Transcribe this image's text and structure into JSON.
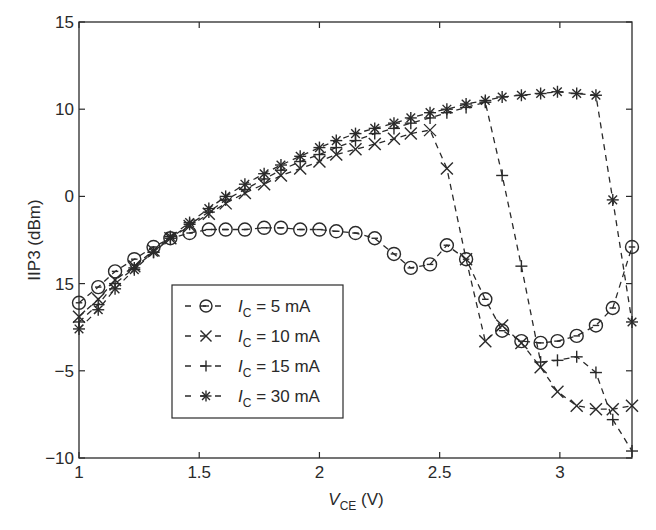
{
  "chart_data": {
    "type": "line",
    "title": "",
    "xlabel": "V_CE (V)",
    "xlabel_main": "V",
    "xlabel_sub": "CE",
    "xlabel_unit": " (V)",
    "ylabel": "IIP3 (dBm)",
    "xlim": [
      1,
      3.3
    ],
    "ylim": [
      -10,
      15
    ],
    "grid": false,
    "legend_position": "lower-left (inside)",
    "x_ticks": [
      1,
      1.5,
      2,
      2.5,
      3
    ],
    "x_tick_labels": [
      "1",
      "1.5",
      "2",
      "2.5",
      "3"
    ],
    "y_ticks": [
      15,
      10,
      5,
      0,
      -5,
      -10
    ],
    "y_tick_labels": [
      "15",
      "10",
      "0",
      "15",
      "−5",
      "−10"
    ],
    "x": [
      1.0,
      1.08,
      1.15,
      1.23,
      1.31,
      1.38,
      1.46,
      1.54,
      1.61,
      1.69,
      1.77,
      1.84,
      1.92,
      2.0,
      2.07,
      2.15,
      2.23,
      2.31,
      2.38,
      2.46,
      2.53,
      2.61,
      2.69,
      2.76,
      2.84,
      2.92,
      2.99,
      3.07,
      3.15,
      3.22,
      3.3
    ],
    "series": [
      {
        "name": "I_C = 5 mA",
        "legend_sub": "C",
        "legend_value": " = 5 mA",
        "marker": "circle",
        "values": [
          -1.1,
          -0.2,
          0.7,
          1.4,
          2.1,
          2.6,
          2.9,
          3.1,
          3.1,
          3.1,
          3.2,
          3.2,
          3.1,
          3.1,
          3.0,
          2.9,
          2.6,
          1.7,
          0.9,
          1.1,
          2.2,
          1.4,
          -0.9,
          -2.7,
          -3.3,
          -3.4,
          -3.3,
          -3.0,
          -2.4,
          -1.4,
          2.1
        ]
      },
      {
        "name": "I_C = 10 mA",
        "legend_sub": "C",
        "legend_value": " = 10 mA",
        "marker": "x",
        "values": [
          -1.9,
          -0.9,
          0.2,
          1.0,
          1.9,
          2.6,
          3.3,
          4.0,
          4.6,
          5.2,
          5.7,
          6.2,
          6.6,
          7.0,
          7.4,
          7.7,
          8.0,
          8.3,
          8.6,
          8.8,
          6.6,
          1.4,
          -3.3,
          -2.4,
          -3.4,
          -4.8,
          -6.2,
          -7.0,
          -7.2,
          -7.2,
          -7.0
        ]
      },
      {
        "name": "I_C = 15 mA",
        "legend_sub": "C",
        "legend_value": " = 15 mA",
        "marker": "plus",
        "values": [
          -2.2,
          -1.2,
          0.0,
          0.9,
          1.8,
          2.6,
          3.4,
          4.1,
          4.8,
          5.4,
          6.0,
          6.5,
          7.0,
          7.4,
          7.8,
          8.2,
          8.6,
          8.9,
          9.2,
          9.5,
          9.8,
          10.1,
          10.4,
          6.2,
          1.0,
          -4.5,
          -4.4,
          -4.2,
          -5.1,
          -7.8,
          -9.6
        ]
      },
      {
        "name": "I_C = 30 mA",
        "legend_sub": "C",
        "legend_value": " = 30 mA",
        "marker": "asterisk",
        "values": [
          -2.6,
          -1.5,
          -0.3,
          0.8,
          1.8,
          2.7,
          3.5,
          4.3,
          5.0,
          5.7,
          6.3,
          6.8,
          7.3,
          7.8,
          8.2,
          8.6,
          8.9,
          9.2,
          9.5,
          9.8,
          10.0,
          10.3,
          10.5,
          10.7,
          10.8,
          10.9,
          11.0,
          10.9,
          10.8,
          4.8,
          -2.2
        ]
      }
    ]
  },
  "colors": {
    "ink": "#2a2a2a",
    "background": "#ffffff"
  }
}
